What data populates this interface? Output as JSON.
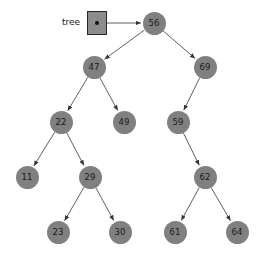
{
  "figure": {
    "kind": "binary-search-tree-diagram",
    "width": 261,
    "height": 256,
    "background_color": "#ffffff"
  },
  "pointer": {
    "label": "tree",
    "target_value": "56",
    "box": {
      "x": 87,
      "y": 11,
      "w": 20,
      "h": 24
    },
    "label_pos": {
      "x": 62,
      "y": 18
    },
    "dot_color": "#111111",
    "box_fill": "#8c8c8c",
    "box_border": "#262626",
    "arrow": {
      "x1": 107,
      "y1": 23,
      "x2": 142,
      "y2": 23
    }
  },
  "style": {
    "node_fill": "#808080",
    "node_text_color": "#1a1a1a",
    "edge_color": "#4d4d4d",
    "edge_width": 0.9,
    "node_radius": 11.5
  },
  "tree": {
    "root": "56",
    "nodes": [
      {
        "id": "n56",
        "value": "56",
        "cx": 154,
        "cy": 23,
        "r": 11.5,
        "level": 0
      },
      {
        "id": "n47",
        "value": "47",
        "cx": 94,
        "cy": 67,
        "r": 11.5,
        "level": 1
      },
      {
        "id": "n69",
        "value": "69",
        "cx": 205,
        "cy": 67,
        "r": 11.5,
        "level": 1
      },
      {
        "id": "n22",
        "value": "22",
        "cx": 61,
        "cy": 122,
        "r": 11.5,
        "level": 2
      },
      {
        "id": "n49",
        "value": "49",
        "cx": 124,
        "cy": 122,
        "r": 11.5,
        "level": 2
      },
      {
        "id": "n59",
        "value": "59",
        "cx": 178,
        "cy": 122,
        "r": 11.5,
        "level": 2
      },
      {
        "id": "n11",
        "value": "11",
        "cx": 27,
        "cy": 177,
        "r": 11.5,
        "level": 3
      },
      {
        "id": "n29",
        "value": "29",
        "cx": 90,
        "cy": 177,
        "r": 11.5,
        "level": 3
      },
      {
        "id": "n62",
        "value": "62",
        "cx": 205,
        "cy": 177,
        "r": 11.5,
        "level": 3
      },
      {
        "id": "n23",
        "value": "23",
        "cx": 58,
        "cy": 232,
        "r": 11.5,
        "level": 4
      },
      {
        "id": "n30",
        "value": "30",
        "cx": 120,
        "cy": 232,
        "r": 11.5,
        "level": 4
      },
      {
        "id": "n61",
        "value": "61",
        "cx": 175,
        "cy": 232,
        "r": 11.5,
        "level": 4
      },
      {
        "id": "n64",
        "value": "64",
        "cx": 237,
        "cy": 232,
        "r": 11.5,
        "level": 4
      }
    ],
    "edges": [
      {
        "from": "n56",
        "to": "n47",
        "side": "left"
      },
      {
        "from": "n56",
        "to": "n69",
        "side": "right"
      },
      {
        "from": "n47",
        "to": "n22",
        "side": "left"
      },
      {
        "from": "n47",
        "to": "n49",
        "side": "right"
      },
      {
        "from": "n22",
        "to": "n11",
        "side": "left"
      },
      {
        "from": "n22",
        "to": "n29",
        "side": "right"
      },
      {
        "from": "n29",
        "to": "n23",
        "side": "left"
      },
      {
        "from": "n29",
        "to": "n30",
        "side": "right"
      },
      {
        "from": "n69",
        "to": "n59",
        "side": "left"
      },
      {
        "from": "n59",
        "to": "n62",
        "side": "right"
      },
      {
        "from": "n62",
        "to": "n61",
        "side": "left"
      },
      {
        "from": "n62",
        "to": "n64",
        "side": "right"
      }
    ]
  }
}
